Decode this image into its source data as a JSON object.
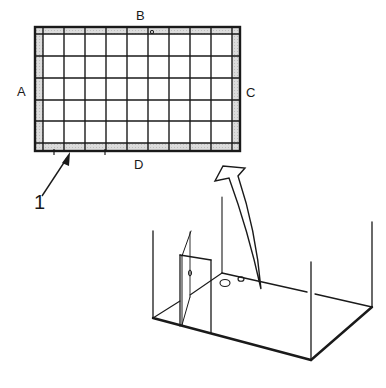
{
  "diagram": {
    "grid": {
      "columns": 9,
      "rows": 5,
      "border_color": "#1a1a1a",
      "frame_fill": "#d4d4d4",
      "edge_labels": {
        "top": "B",
        "left": "A",
        "right": "C",
        "bottom": "D"
      }
    },
    "callouts": [
      {
        "id": "1",
        "label": "1",
        "target": "bottom frame strip of grid"
      }
    ],
    "box": {
      "parts": [
        "floor",
        "corner posts",
        "door panel",
        "floor holes"
      ],
      "floor_holes": 2
    },
    "arrow": {
      "direction": "from box floor up to grid panel"
    }
  }
}
